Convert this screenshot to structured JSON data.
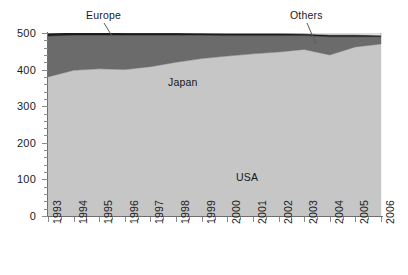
{
  "chart_data": {
    "type": "area",
    "stacked": true,
    "title": "",
    "subtitle": "",
    "xlabel": "",
    "ylabel": "",
    "ylim": [
      0,
      500
    ],
    "yticks": [
      0,
      100,
      200,
      300,
      400,
      500
    ],
    "ytick_labels": [
      "0",
      "100",
      "200",
      "300",
      "400",
      "500"
    ],
    "y_minor_interval": 20,
    "grid": false,
    "legend_position": "in-plot-annotations",
    "x": [
      1993,
      1994,
      1995,
      1996,
      1997,
      1998,
      1999,
      2000,
      2001,
      2002,
      2003,
      2004,
      2005,
      2006
    ],
    "xtick_labels": [
      "1993",
      "1994",
      "1995",
      "1996",
      "1997",
      "1998",
      "1999",
      "2000",
      "2001",
      "2002",
      "2003",
      "2004",
      "2005",
      "2006"
    ],
    "series": [
      {
        "name": "USA",
        "color": "#c6c6c6",
        "label_in_plot": "USA",
        "values": [
          380,
          398,
          402,
          400,
          408,
          420,
          430,
          437,
          443,
          448,
          455,
          440,
          462,
          470
        ]
      },
      {
        "name": "Japan",
        "color": "#6b6b6b",
        "label_in_plot": "Japan",
        "values": [
          112,
          96,
          92,
          94,
          86,
          74,
          64,
          56,
          50,
          45,
          38,
          50,
          28,
          20
        ]
      },
      {
        "name": "Europe",
        "color": "#1c1c1c",
        "label_in_plot": "Europe",
        "values": [
          8,
          8,
          8,
          7,
          7,
          7,
          6,
          6,
          6,
          6,
          5,
          5,
          5,
          4
        ]
      },
      {
        "name": "Others",
        "color": "#ffffff",
        "label_in_plot": "Others",
        "values": [
          0,
          0,
          0,
          0,
          0,
          0,
          0,
          2,
          2,
          2,
          3,
          5,
          5,
          6
        ]
      }
    ],
    "totals": [
      500,
      502,
      502,
      501,
      501,
      501,
      500,
      501,
      501,
      501,
      501,
      500,
      500,
      500
    ],
    "annotations": [
      {
        "text": "Europe",
        "points_to_x": 1995,
        "points_to_series": "Europe"
      },
      {
        "text": "Others",
        "points_to_x": 2004,
        "points_to_series": "Others"
      }
    ]
  },
  "axes": {
    "y_labels": [
      "500",
      "400",
      "300",
      "200",
      "100",
      "0"
    ],
    "x_labels": [
      "1993",
      "1994",
      "1995",
      "1996",
      "1997",
      "1998",
      "1999",
      "2000",
      "2001",
      "2002",
      "2003",
      "2004",
      "2005",
      "2006"
    ]
  },
  "labels": {
    "japan": "Japan",
    "usa": "USA",
    "europe": "Europe",
    "others": "Others"
  },
  "colors": {
    "usa": "#c6c6c6",
    "japan": "#6b6b6b",
    "europe": "#1c1c1c",
    "others": "#ffffff",
    "axis": "#6e6e6e",
    "text": "#1b1b1b",
    "background": "#ffffff"
  }
}
